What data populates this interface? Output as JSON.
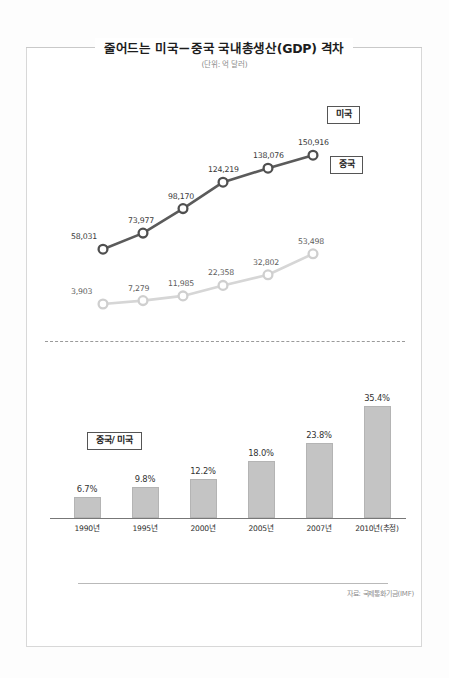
{
  "header": {
    "title": "줄어드는 미국－중국 국내총생산(GDP) 격차",
    "subtitle": "(단위: 억 달러)"
  },
  "callouts": {
    "usa": "미국",
    "china": "중국",
    "ratio": "중국/ 미국"
  },
  "footer": {
    "source": "자료: 국제통화기금(IMF)"
  },
  "chart_data": [
    {
      "type": "line",
      "title": "줄어드는 미국－중국 국내총생산(GDP) 격차",
      "subtitle": "(단위: 억 달러)",
      "xlabel": "",
      "ylabel": "억 달러",
      "grid": false,
      "legend_position": "right-inline-callouts",
      "x": [
        "1990년",
        "1995년",
        "2000년",
        "2005년",
        "2007년",
        "2010년(추정)"
      ],
      "ylim": [
        0,
        160000
      ],
      "series": [
        {
          "name": "미국",
          "color": "#5b5b5b",
          "values": [
            58031,
            73977,
            98170,
            124219,
            138076,
            150916
          ],
          "labels": [
            "58,031",
            "73,977",
            "98,170",
            "124,219",
            "138,076",
            "150,916"
          ]
        },
        {
          "name": "중국",
          "color": "#d4d4d4",
          "values": [
            3903,
            7279,
            11985,
            22358,
            32802,
            53498
          ],
          "labels": [
            "3,903",
            "7,279",
            "11,985",
            "22,358",
            "32,802",
            "53,498"
          ]
        }
      ]
    },
    {
      "type": "bar",
      "title": "중국/ 미국",
      "xlabel": "",
      "ylabel": "%",
      "grid": false,
      "ylim": [
        0,
        38
      ],
      "bar_color": "#c4c4c4",
      "categories": [
        "1990년",
        "1995년",
        "2000년",
        "2005년",
        "2007년",
        "2010년(추정)"
      ],
      "values": [
        6.7,
        9.8,
        12.2,
        18.0,
        23.8,
        35.4
      ],
      "labels": [
        "6.7%",
        "9.8%",
        "12.2%",
        "18.0%",
        "23.8%",
        "35.4%"
      ]
    }
  ]
}
